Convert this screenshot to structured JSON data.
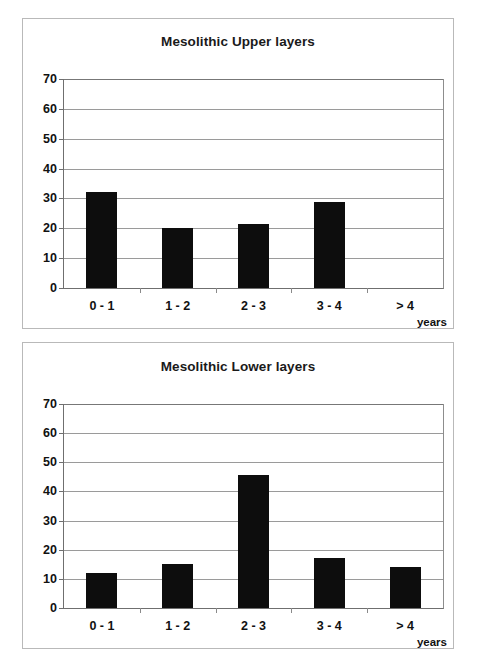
{
  "charts": [
    {
      "id": "upper",
      "title": "Mesolithic Upper layers",
      "xunit": "years",
      "yticks": [
        "0",
        "10",
        "20",
        "30",
        "40",
        "50",
        "60",
        "70"
      ],
      "categories": [
        "0 - 1",
        "1 - 2",
        "2 - 3",
        "3 - 4",
        "> 4"
      ]
    },
    {
      "id": "lower",
      "title": "Mesolithic Lower layers",
      "xunit": "years",
      "yticks": [
        "0",
        "10",
        "20",
        "30",
        "40",
        "50",
        "60",
        "70"
      ],
      "categories": [
        "0 - 1",
        "1 - 2",
        "2 - 3",
        "3 - 4",
        "> 4"
      ]
    }
  ],
  "chart_data": [
    {
      "type": "bar",
      "title": "Mesolithic Upper layers",
      "xlabel": "years",
      "ylabel": "",
      "categories": [
        "0 - 1",
        "1 - 2",
        "2 - 3",
        "3 - 4",
        "> 4"
      ],
      "values": [
        32,
        20,
        21.5,
        28.7,
        0
      ],
      "ylim": [
        0,
        70
      ],
      "ytick_step": 10,
      "yticks": [
        0,
        10,
        20,
        30,
        40,
        50,
        60,
        70
      ],
      "grid": true,
      "legend": "none",
      "bar_color": "#0d0d0d"
    },
    {
      "type": "bar",
      "title": "Mesolithic Lower layers",
      "xlabel": "years",
      "ylabel": "",
      "categories": [
        "0 - 1",
        "1 - 2",
        "2 - 3",
        "3 - 4",
        "> 4"
      ],
      "values": [
        12,
        15,
        45.5,
        17,
        14
      ],
      "ylim": [
        0,
        70
      ],
      "ytick_step": 10,
      "yticks": [
        0,
        10,
        20,
        30,
        40,
        50,
        60,
        70
      ],
      "grid": true,
      "legend": "none",
      "bar_color": "#0d0d0d"
    }
  ]
}
